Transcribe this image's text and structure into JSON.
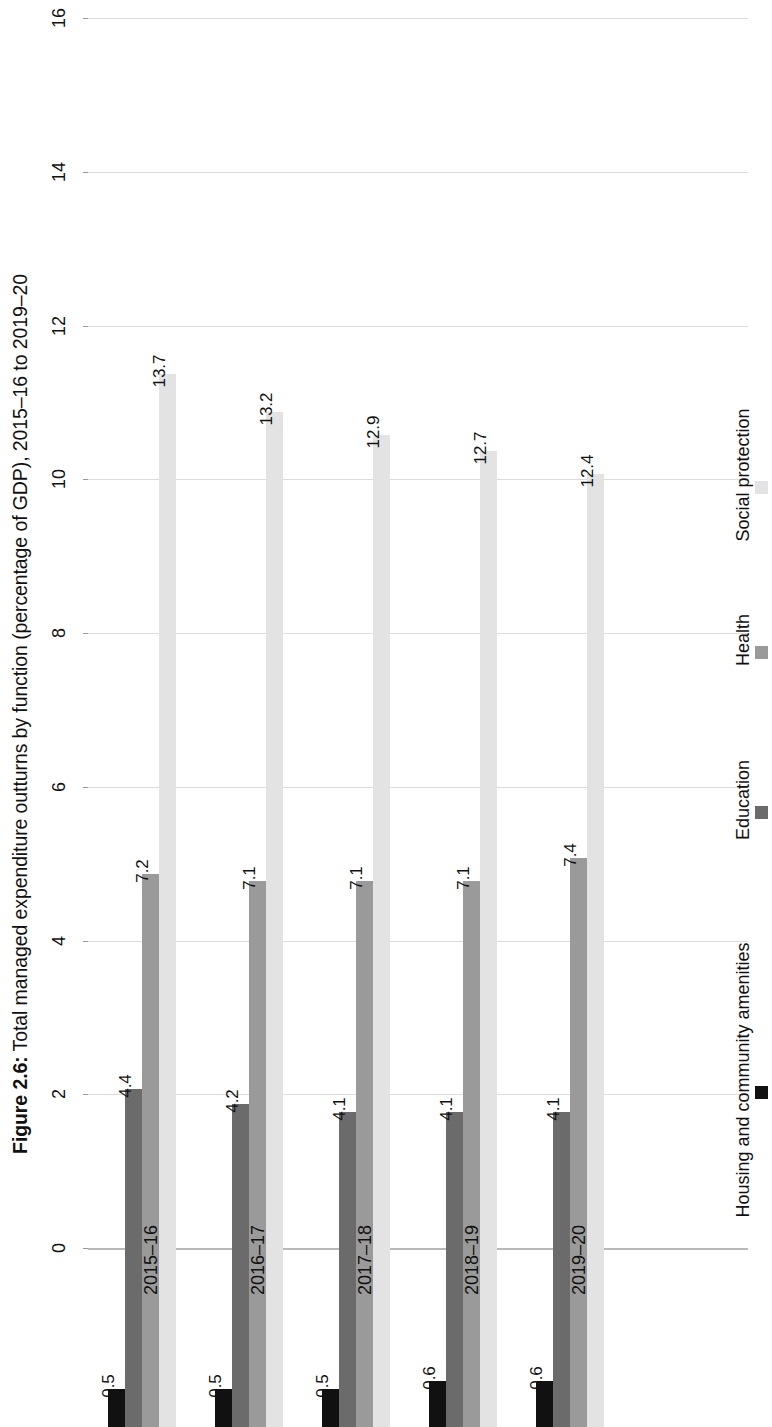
{
  "title": {
    "figure_number": "Figure 2.6:",
    "text": " Total managed expenditure outturns by function (percentage of GDP), 2015–16 to 2019–20"
  },
  "chart_data": {
    "type": "bar",
    "title": "Figure 2.6: Total managed expenditure outturns by function (percentage of GDP), 2015–16 to 2019–20",
    "orientation": "rotated-90-ccw",
    "xlabel": "",
    "ylabel": "",
    "ylim": [
      0,
      16
    ],
    "yticks": [
      "0",
      "2",
      "4",
      "6",
      "8",
      "10",
      "12",
      "14",
      "16"
    ],
    "grid": true,
    "legend_position": "right",
    "categories": [
      "2015–16",
      "2016–17",
      "2017–18",
      "2018–19",
      "2019–20"
    ],
    "series": [
      {
        "name": "Housing and community amenities",
        "color": "#111111",
        "values": [
          0.5,
          0.5,
          0.5,
          0.6,
          0.6
        ],
        "labels": [
          "0.5",
          "0.5",
          "0.5",
          "0.6",
          "0.6"
        ]
      },
      {
        "name": "Education",
        "color": "#6b6b6b",
        "values": [
          4.4,
          4.2,
          4.1,
          4.1,
          4.1
        ],
        "labels": [
          "4.4",
          "4.2",
          "4.1",
          "4.1",
          "4.1"
        ]
      },
      {
        "name": "Health",
        "color": "#9a9a9a",
        "values": [
          7.2,
          7.1,
          7.1,
          7.1,
          7.4
        ],
        "labels": [
          "7.2",
          "7.1",
          "7.1",
          "7.1",
          "7.4"
        ]
      },
      {
        "name": "Social protection",
        "color": "#e3e3e3",
        "values": [
          13.7,
          13.2,
          12.9,
          12.7,
          12.4
        ],
        "labels": [
          "13.7",
          "13.2",
          "12.9",
          "12.7",
          "12.4"
        ]
      }
    ]
  },
  "legend": {
    "items": [
      {
        "label": "Housing and community amenities",
        "color": "#111111"
      },
      {
        "label": "Education",
        "color": "#6b6b6b"
      },
      {
        "label": "Health",
        "color": "#9a9a9a"
      },
      {
        "label": "Social protection",
        "color": "#e3e3e3"
      }
    ]
  }
}
